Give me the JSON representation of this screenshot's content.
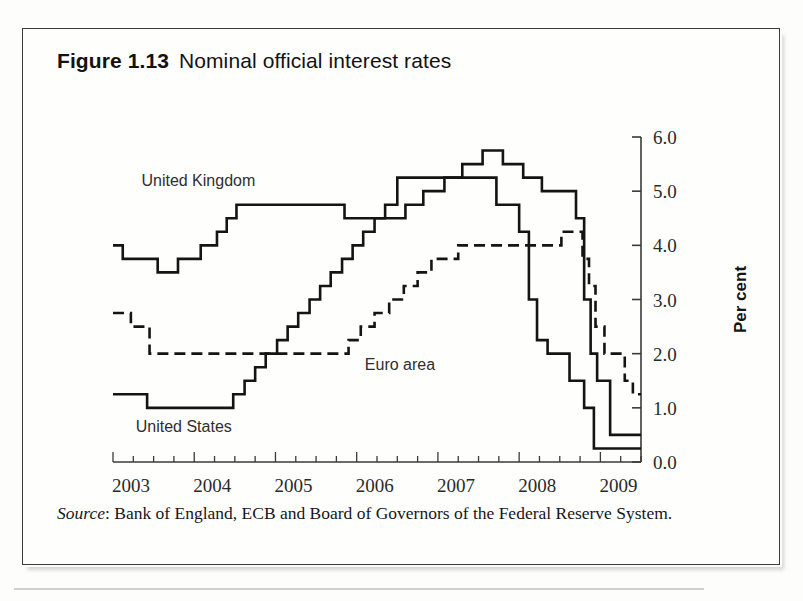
{
  "figure": {
    "number": "Figure 1.13",
    "title": "Nominal official interest rates"
  },
  "source": {
    "label": "Source",
    "separator": ":",
    "text": " Bank of England, ECB and Board of Governors of the Federal Reserve System."
  },
  "series_labels": {
    "uk": "United Kingdom",
    "euro": "Euro area",
    "us": "United States"
  },
  "axis": {
    "y_title": "Per cent",
    "y_ticks": [
      "0.0",
      "1.0",
      "2.0",
      "3.0",
      "4.0",
      "5.0",
      "6.0"
    ],
    "x_ticks": [
      "2003",
      "2004",
      "2005",
      "2006",
      "2007",
      "2008",
      "2009"
    ]
  },
  "colors": {
    "ink": "#141414",
    "axis": "#3a3a3a",
    "frame": "#3b3b3b",
    "paper": "#fefefd"
  },
  "chart_data": {
    "type": "line",
    "title": "Nominal official interest rates",
    "subtitle": "",
    "xlabel": "",
    "ylabel": "Per cent",
    "xlim": [
      2003.0,
      2009.5
    ],
    "ylim": [
      0.0,
      6.0
    ],
    "grid": false,
    "legend": "inline annotations",
    "y_ticks": [
      0.0,
      1.0,
      2.0,
      3.0,
      4.0,
      5.0,
      6.0
    ],
    "x_ticks": [
      2003,
      2004,
      2005,
      2006,
      2007,
      2008,
      2009
    ],
    "x_minor_tick_interval": 0.25,
    "step_style": "post",
    "series": [
      {
        "name": "United Kingdom",
        "style": "solid",
        "x": [
          2003.0,
          2003.12,
          2003.55,
          2003.8,
          2004.08,
          2004.28,
          2004.4,
          2004.52,
          2005.85,
          2006.6,
          2006.82,
          2007.08,
          2007.3,
          2007.55,
          2007.8,
          2008.05,
          2008.28,
          2008.7,
          2008.8,
          2008.88,
          2008.96,
          2009.12,
          2009.5
        ],
        "y": [
          4.0,
          3.75,
          3.5,
          3.75,
          4.0,
          4.25,
          4.5,
          4.75,
          4.5,
          4.75,
          5.0,
          5.25,
          5.5,
          5.75,
          5.5,
          5.25,
          5.0,
          4.5,
          3.0,
          2.0,
          1.5,
          0.5,
          0.5
        ]
      },
      {
        "name": "Euro area",
        "style": "dashed",
        "x": [
          2003.0,
          2003.22,
          2003.45,
          2005.9,
          2006.05,
          2006.22,
          2006.4,
          2006.58,
          2006.75,
          2006.92,
          2007.08,
          2007.25,
          2007.42,
          2007.58,
          2008.52,
          2008.78,
          2008.86,
          2008.94,
          2009.05,
          2009.18,
          2009.3,
          2009.4,
          2009.5
        ],
        "y": [
          2.75,
          2.5,
          2.0,
          2.25,
          2.5,
          2.75,
          3.0,
          3.25,
          3.5,
          3.75,
          3.75,
          4.0,
          4.0,
          4.0,
          4.25,
          3.75,
          3.25,
          2.5,
          2.0,
          2.0,
          1.5,
          1.25,
          1.25
        ]
      },
      {
        "name": "United States",
        "style": "solid",
        "x": [
          2003.0,
          2003.42,
          2004.48,
          2004.62,
          2004.75,
          2004.88,
          2005.02,
          2005.15,
          2005.28,
          2005.42,
          2005.55,
          2005.68,
          2005.82,
          2005.95,
          2006.08,
          2006.22,
          2006.35,
          2006.5,
          2007.72,
          2008.0,
          2008.12,
          2008.22,
          2008.35,
          2008.62,
          2008.8,
          2008.92,
          2009.5
        ],
        "y": [
          1.25,
          1.0,
          1.25,
          1.5,
          1.75,
          2.0,
          2.25,
          2.5,
          2.75,
          3.0,
          3.25,
          3.5,
          3.75,
          4.0,
          4.25,
          4.5,
          4.75,
          5.25,
          4.75,
          4.25,
          3.0,
          2.25,
          2.0,
          1.5,
          1.0,
          0.25,
          0.25
        ]
      }
    ]
  }
}
